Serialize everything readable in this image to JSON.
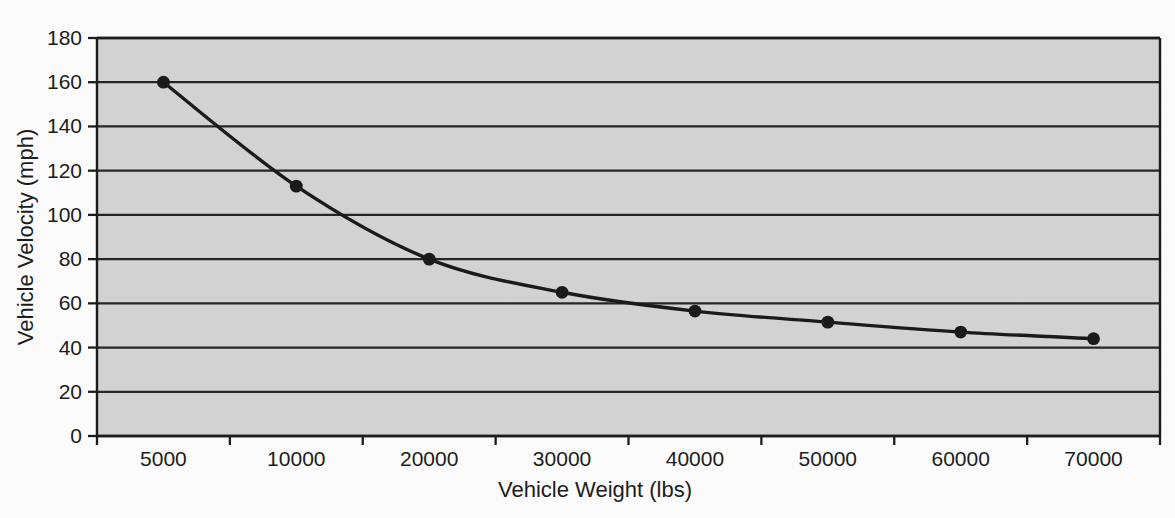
{
  "chart_data": {
    "type": "line",
    "title": "",
    "xlabel": "Vehicle Weight (lbs)",
    "ylabel": "Vehicle Velocity (mph)",
    "categories": [
      "5000",
      "10000",
      "20000",
      "30000",
      "40000",
      "50000",
      "60000",
      "70000"
    ],
    "x": [
      5000,
      10000,
      20000,
      30000,
      40000,
      50000,
      60000,
      70000
    ],
    "values": [
      160,
      113,
      80,
      65,
      56.5,
      51.5,
      47,
      44
    ],
    "series": [
      {
        "name": "Vehicle Velocity",
        "values": [
          160,
          113,
          80,
          65,
          56.5,
          51.5,
          47,
          44
        ]
      }
    ],
    "ylim": [
      0,
      180
    ],
    "ytick_labels": [
      "0",
      "20",
      "40",
      "60",
      "80",
      "100",
      "120",
      "140",
      "160",
      "180"
    ],
    "ytick_values": [
      0,
      20,
      40,
      60,
      80,
      100,
      120,
      140,
      160,
      180
    ],
    "grid": "horizontal",
    "legend": "none",
    "marker": "filled-circle",
    "line_color": "#1a1a1a",
    "marker_color": "#1a1a1a",
    "plot_background_color": "#d4d4d4",
    "gridline_color": "#262626",
    "axis_color": "#1c1c1c",
    "page_background_color": "#fdfdfd",
    "axis_note": "Category axis: tick marks at category boundaries, labels centered between ticks"
  }
}
